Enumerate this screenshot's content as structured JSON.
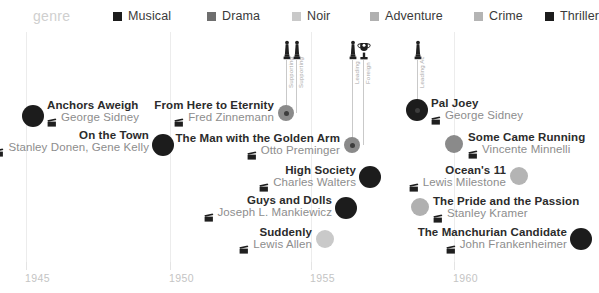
{
  "legend": {
    "label": "genre",
    "items": [
      {
        "name": "Musical",
        "color": "#1c1c1c",
        "x": 113
      },
      {
        "name": "Drama",
        "color": "#6e6e6e",
        "x": 207
      },
      {
        "name": "Noir",
        "color": "#c9c9c9",
        "x": 292
      },
      {
        "name": "Adventure",
        "color": "#b0b0b0",
        "x": 370
      },
      {
        "name": "Crime",
        "color": "#b4b4b4",
        "x": 474
      },
      {
        "name": "Thriller",
        "color": "#1c1c1c",
        "x": 545
      }
    ]
  },
  "axis": {
    "ticks": [
      {
        "label": "1945",
        "x": 26
      },
      {
        "label": "1950",
        "x": 170
      },
      {
        "label": "1955",
        "x": 311
      },
      {
        "label": "1960",
        "x": 454
      }
    ]
  },
  "awards": [
    {
      "icon": "oscar-statuette-icon",
      "label": "Supporting",
      "x": 286,
      "icon_x": 280,
      "icon_y": 40,
      "lbl_x": 288,
      "lbl_y": 88,
      "stem_top": 60,
      "stem_bottom": 113
    },
    {
      "icon": "oscar-statuette-icon",
      "label": "Supporting",
      "x": 296,
      "icon_x": 290,
      "icon_y": 40,
      "lbl_x": 298,
      "lbl_y": 88,
      "stem_top": 60,
      "stem_bottom": 113
    },
    {
      "icon": "oscar-statuette-icon",
      "label": "Leading",
      "x": 352,
      "icon_x": 346,
      "icon_y": 40,
      "lbl_x": 354,
      "lbl_y": 84,
      "stem_top": 60,
      "stem_bottom": 145
    },
    {
      "icon": "golden-globe-trophy-icon",
      "label": "Foreign",
      "x": 363,
      "icon_x": 357,
      "icon_y": 40,
      "lbl_x": 365,
      "lbl_y": 84,
      "stem_top": 60,
      "stem_bottom": 145
    },
    {
      "icon": "oscar-statuette-icon",
      "label": "Leading Ac",
      "x": 417,
      "icon_x": 411,
      "icon_y": 40,
      "lbl_x": 419,
      "lbl_y": 88,
      "stem_top": 60,
      "stem_bottom": 110
    }
  ],
  "films": [
    {
      "title": "Anchors Aweigh",
      "director": "George Sidney",
      "genre": "Musical",
      "color": "#1c1c1c",
      "dot_x": 33,
      "dot_y": 116,
      "dot_r": 11,
      "award": false,
      "side": "left",
      "tx": 47,
      "ty": 99
    },
    {
      "title": "On the Town",
      "director": "Stanley Donen, Gene Kelly",
      "genre": "Musical",
      "color": "#1c1c1c",
      "dot_x": 163,
      "dot_y": 145,
      "dot_r": 11,
      "award": false,
      "side": "right",
      "tx": 149,
      "ty": 129
    },
    {
      "title": "From Here to Eternity",
      "director": "Fred Zinnemann",
      "genre": "Drama",
      "color": "#8a8a8a",
      "dot_x": 286,
      "dot_y": 113,
      "dot_r": 8,
      "award": true,
      "side": "right",
      "tx": 274,
      "ty": 99
    },
    {
      "title": "The Man with the Golden Arm",
      "director": "Otto Preminger",
      "genre": "Drama",
      "color": "#8a8a8a",
      "dot_x": 352,
      "dot_y": 145,
      "dot_r": 8,
      "award": true,
      "side": "right",
      "tx": 340,
      "ty": 132
    },
    {
      "title": "Pal Joey",
      "director": "George Sidney",
      "genre": "Musical",
      "color": "#1c1c1c",
      "dot_x": 417,
      "dot_y": 110,
      "dot_r": 11,
      "award": true,
      "side": "left",
      "tx": 431,
      "ty": 97
    },
    {
      "title": "Some Came Running",
      "director": "Vincente Minnelli",
      "genre": "Drama",
      "color": "#8a8a8a",
      "dot_x": 454,
      "dot_y": 144,
      "dot_r": 9,
      "award": false,
      "side": "left",
      "tx": 468,
      "ty": 131
    },
    {
      "title": "High Society",
      "director": "Charles Walters",
      "genre": "Musical",
      "color": "#1c1c1c",
      "dot_x": 370,
      "dot_y": 177,
      "dot_r": 11,
      "award": false,
      "side": "right",
      "tx": 356,
      "ty": 164
    },
    {
      "title": "Ocean's 11",
      "director": "Lewis Milestone",
      "genre": "Crime",
      "color": "#b4b4b4",
      "dot_x": 519,
      "dot_y": 176,
      "dot_r": 9,
      "award": false,
      "side": "right",
      "tx": 506,
      "ty": 164
    },
    {
      "title": "Guys and Dolls",
      "director": "Joseph L. Mankiewicz",
      "genre": "Musical",
      "color": "#1c1c1c",
      "dot_x": 346,
      "dot_y": 208,
      "dot_r": 11,
      "award": false,
      "side": "right",
      "tx": 332,
      "ty": 194
    },
    {
      "title": "The Pride and the Passion",
      "director": "Stanley Kramer",
      "genre": "Adventure",
      "color": "#b0b0b0",
      "dot_x": 420,
      "dot_y": 207,
      "dot_r": 9,
      "award": false,
      "side": "left",
      "tx": 433,
      "ty": 195
    },
    {
      "title": "Suddenly",
      "director": "Lewis Allen",
      "genre": "Noir",
      "color": "#c9c9c9",
      "dot_x": 325,
      "dot_y": 239,
      "dot_r": 9,
      "award": false,
      "side": "right",
      "tx": 312,
      "ty": 226
    },
    {
      "title": "The Manchurian Candidate",
      "director": "John Frankenheimer",
      "genre": "Thriller",
      "color": "#1c1c1c",
      "dot_x": 581,
      "dot_y": 239,
      "dot_r": 11,
      "award": false,
      "side": "right",
      "tx": 567,
      "ty": 226
    }
  ],
  "chart_data": {
    "type": "scatter",
    "title": "genre",
    "xlabel": "",
    "ylabel": "",
    "xlim": [
      1944,
      1963
    ],
    "grid": true,
    "legend_position": "top",
    "legend": [
      "Musical",
      "Drama",
      "Noir",
      "Adventure",
      "Crime",
      "Thriller"
    ],
    "xticks": [
      1945,
      1950,
      1955,
      1960
    ],
    "points": [
      {
        "label": "Anchors Aweigh",
        "director": "George Sidney",
        "year": 1945,
        "genre": "Musical",
        "award": null
      },
      {
        "label": "On the Town",
        "director": "Stanley Donen, Gene Kelly",
        "year": 1949,
        "genre": "Musical",
        "award": null
      },
      {
        "label": "From Here to Eternity",
        "director": "Fred Zinnemann",
        "year": 1953,
        "genre": "Drama",
        "award": "Supporting"
      },
      {
        "label": "The Man with the Golden Arm",
        "director": "Otto Preminger",
        "year": 1955,
        "genre": "Drama",
        "award": "Leading"
      },
      {
        "label": "Pal Joey",
        "director": "George Sidney",
        "year": 1957,
        "genre": "Musical",
        "award": "Leading Actor"
      },
      {
        "label": "Some Came Running",
        "director": "Vincente Minnelli",
        "year": 1958,
        "genre": "Drama",
        "award": null
      },
      {
        "label": "High Society",
        "director": "Charles Walters",
        "year": 1956,
        "genre": "Musical",
        "award": null
      },
      {
        "label": "Ocean's 11",
        "director": "Lewis Milestone",
        "year": 1960,
        "genre": "Crime",
        "award": null
      },
      {
        "label": "Guys and Dolls",
        "director": "Joseph L. Mankiewicz",
        "year": 1955,
        "genre": "Musical",
        "award": null
      },
      {
        "label": "The Pride and the Passion",
        "director": "Stanley Kramer",
        "year": 1957,
        "genre": "Adventure",
        "award": null
      },
      {
        "label": "Suddenly",
        "director": "Lewis Allen",
        "year": 1954,
        "genre": "Noir",
        "award": null
      },
      {
        "label": "The Manchurian Candidate",
        "director": "John Frankenheimer",
        "year": 1962,
        "genre": "Thriller",
        "award": null
      }
    ]
  }
}
